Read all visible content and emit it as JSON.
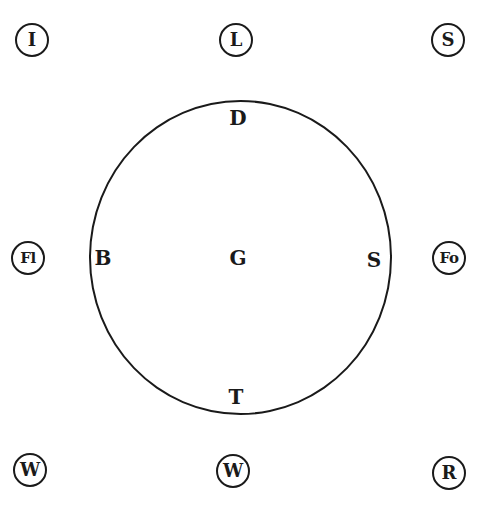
{
  "diagram": {
    "outer_nodes": {
      "top_left": "I",
      "top_center": "L",
      "top_right": "S",
      "middle_left": "Fl",
      "middle_right": "Fo",
      "bottom_left": "W",
      "bottom_center": "W",
      "bottom_right": "R"
    },
    "circle_labels": {
      "top": "D",
      "left": "B",
      "center": "G",
      "right": "S",
      "bottom": "T"
    }
  }
}
